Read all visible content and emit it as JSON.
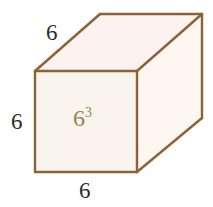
{
  "figure": {
    "type": "geometry-diagram",
    "shape_name": "cube",
    "background_color": "#ffffff",
    "edge_color": "#8d6234",
    "face_colors": {
      "front": "#faf4ef",
      "top": "#fcf2f0",
      "right": "#fdf6f1"
    },
    "labels": {
      "top_depth": "6",
      "left_height": "6",
      "bottom_width": "6",
      "volume_base": "6",
      "volume_exponent": "3",
      "dimension_color": "#2b2b2b",
      "volume_color": "#9c8050"
    },
    "geometry": {
      "front_face": [
        [
          35,
          71
        ],
        [
          137,
          71
        ],
        [
          137,
          172
        ],
        [
          35,
          172
        ]
      ],
      "top_face": [
        [
          35,
          71
        ],
        [
          100,
          14
        ],
        [
          202,
          14
        ],
        [
          137,
          71
        ]
      ],
      "right_face": [
        [
          137,
          71
        ],
        [
          202,
          14
        ],
        [
          202,
          118
        ],
        [
          137,
          172
        ]
      ]
    }
  }
}
